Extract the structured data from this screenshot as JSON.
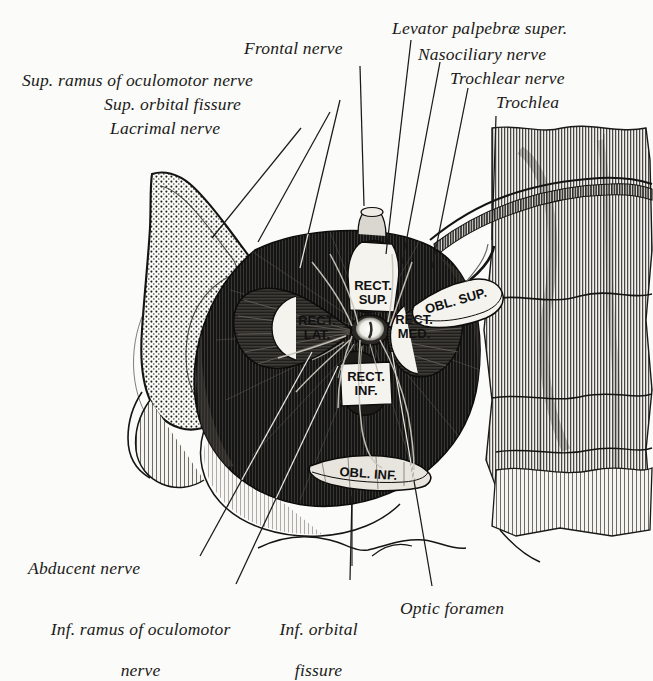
{
  "figure": {
    "style": "wood-engraving anatomical plate",
    "background_color": "#fbfbf9",
    "ink_color": "#1a1a18"
  },
  "labels": {
    "frontal_nerve": "Frontal nerve",
    "levator_palpebrae": "Levator palpebræ super.",
    "nasociliary_nerve": "Nasociliary nerve",
    "trochlear_nerve": "Trochlear nerve",
    "trochlea": "Trochlea",
    "sup_ramus_oculomotor": "Sup. ramus of oculomotor nerve",
    "sup_orbital_fissure": "Sup. orbital fissure",
    "lacrimal_nerve": "Lacrimal nerve",
    "abducent_nerve": "Abducent nerve",
    "inf_ramus_oculomotor_line1": "Inf. ramus of oculomotor",
    "inf_ramus_oculomotor_line2": "nerve",
    "inf_orbital_fissure_line1": "Inf. orbital",
    "inf_orbital_fissure_line2": "fissure",
    "optic_foramen": "Optic foramen"
  },
  "muscle_tags": {
    "rect_sup_line1": "RECT.",
    "rect_sup_line2": "SUP.",
    "rect_lat_line1": "RECT.",
    "rect_lat_line2": "LAT.",
    "rect_med_line1": "RECT.",
    "rect_med_line2": "MED.",
    "rect_inf_line1": "RECT.",
    "rect_inf_line2": "INF.",
    "obl_sup": "OBL. SUP.",
    "obl_inf": "OBL. INF."
  }
}
